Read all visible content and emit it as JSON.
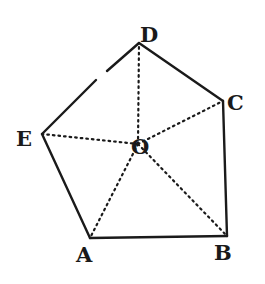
{
  "figure": {
    "type": "regular-pentagon",
    "stroke_color": "#1a1a1a",
    "background": "#ffffff",
    "vertices": [
      {
        "id": "A",
        "label": "A",
        "x": 90,
        "y": 238,
        "lx": 76,
        "ly": 262
      },
      {
        "id": "B",
        "label": "B",
        "x": 227,
        "y": 236,
        "lx": 214,
        "ly": 260
      },
      {
        "id": "C",
        "label": "C",
        "x": 223,
        "y": 101,
        "lx": 227,
        "ly": 110
      },
      {
        "id": "D",
        "label": "D",
        "x": 139,
        "y": 43,
        "lx": 140,
        "ly": 42
      },
      {
        "id": "E",
        "label": "E",
        "x": 42,
        "y": 134,
        "lx": 16,
        "ly": 146
      }
    ],
    "center": {
      "id": "O",
      "label": "O",
      "x": 138,
      "y": 144,
      "lx": 131,
      "ly": 154
    },
    "edges": [
      {
        "from": "A",
        "to": "B",
        "style": "solid"
      },
      {
        "from": "B",
        "to": "C",
        "style": "solid"
      },
      {
        "from": "C",
        "to": "D",
        "style": "solid"
      },
      {
        "from": "D",
        "to": "E",
        "style": "solid",
        "gap": {
          "x1": 107,
          "y1": 71,
          "x2": 96,
          "y2": 80
        }
      },
      {
        "from": "E",
        "to": "A",
        "style": "solid"
      }
    ],
    "radii": [
      {
        "from": "O",
        "to": "A",
        "style": "dotted"
      },
      {
        "from": "O",
        "to": "B",
        "style": "dotted"
      },
      {
        "from": "O",
        "to": "C",
        "style": "dotted"
      },
      {
        "from": "O",
        "to": "D",
        "style": "dotted"
      },
      {
        "from": "O",
        "to": "E",
        "style": "dotted"
      }
    ]
  }
}
